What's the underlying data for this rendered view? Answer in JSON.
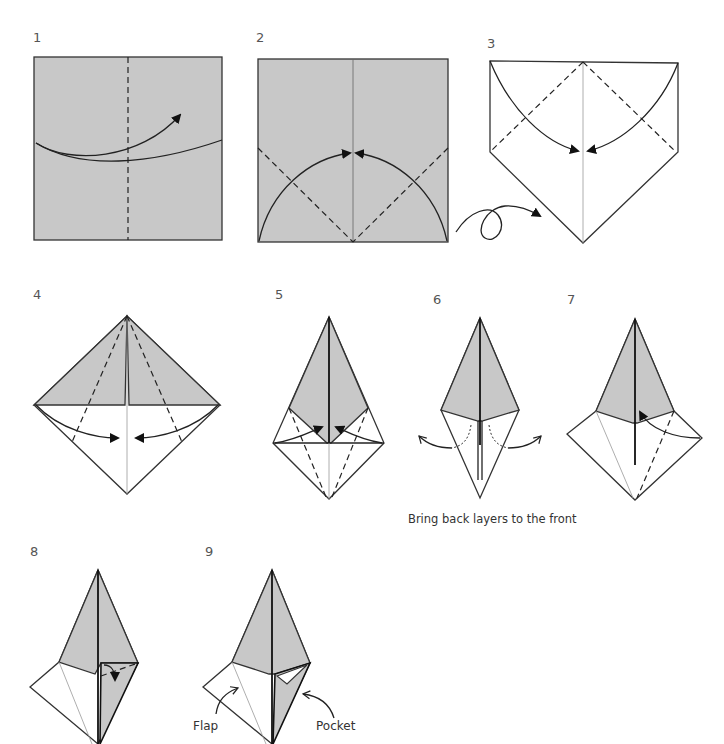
{
  "diagram": {
    "colors": {
      "paper_colored": "#c8c8c8",
      "paper_white": "#ffffff",
      "line": "#222222"
    },
    "steps": [
      {
        "number": "1",
        "description": "Square, colored side up; valley fold in half along vertical dashed line"
      },
      {
        "number": "2",
        "description": "Fold bottom corners up to center crease along dashed diagonals"
      },
      {
        "number": "3",
        "description": "Turn over; fold top corners down to center"
      },
      {
        "number": "4",
        "description": "Fold lower edges to center line"
      },
      {
        "number": "5",
        "description": "Fold lower flaps up to center"
      },
      {
        "number": "6",
        "description": "Bring back layers to the front"
      },
      {
        "number": "7",
        "description": "Fold right flap up along dashed line"
      },
      {
        "number": "8",
        "description": "Fold small corner down into pocket"
      },
      {
        "number": "9",
        "description": "Result showing flap and pocket"
      }
    ],
    "captions": {
      "step6": "Bring back layers to the front"
    },
    "labels": {
      "flap": "Flap",
      "pocket": "Pocket"
    },
    "symbols": {
      "turn_over": "loop-arrow (turn paper over)",
      "valley_fold": "dashed line",
      "fold_arrow": "curved arrow with filled head"
    }
  }
}
